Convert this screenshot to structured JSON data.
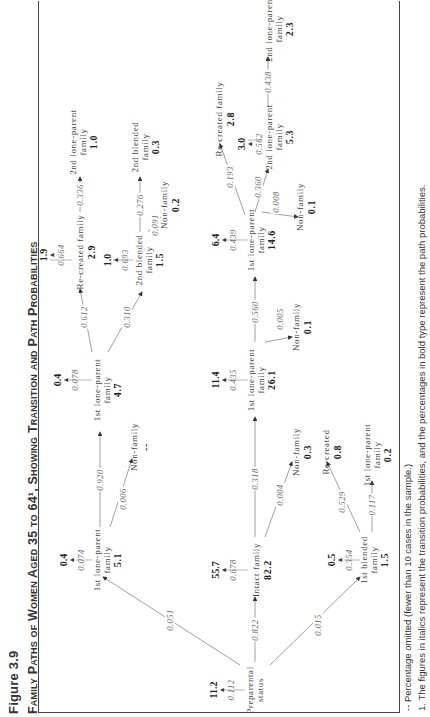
{
  "figure": {
    "label": "Figure 3.9",
    "title": "Family Paths of Women Aged 35 to 64¹, Showing Transition and Path Probabilities"
  },
  "nodes": {
    "preparental": {
      "label": "Preparental status",
      "line1": "Preparental",
      "line2": "status",
      "stay_prob": "0.112",
      "stay_pct": "11.2"
    },
    "lone1_a": {
      "line1": "1st lone-parent",
      "line2": "family",
      "pct": "5.1",
      "stay_prob": "0.074",
      "stay_pct": "0.4"
    },
    "nonfamily_a": {
      "line1": "Non-family",
      "pct": "--"
    },
    "lone1_b": {
      "line1": "1st lone-parent",
      "line2": "family",
      "pct": "4.7",
      "stay_prob": "0.078",
      "stay_pct": "0.4"
    },
    "recreated_a": {
      "line1": "Re-created family",
      "pct": "2.9",
      "stay_prob": "0.664",
      "stay_pct": "1.9"
    },
    "blended2_a": {
      "line1": "2nd blended",
      "line2": "family",
      "pct": "1.5",
      "stay_prob": "0.693",
      "stay_pct": "1.0"
    },
    "lone2_a": {
      "line1": "2nd  lone-parent",
      "line2": "family",
      "pct": "1.0"
    },
    "blended2_b": {
      "line1": "2nd blended",
      "line2": "family",
      "pct": "0.3"
    },
    "nonfamily_b": {
      "line1": "Non-family",
      "pct": "0.2"
    },
    "intact": {
      "line1": "Intact family",
      "pct": "82.2",
      "stay_prob": "0.678",
      "stay_pct": "55.7"
    },
    "lone1_c": {
      "line1": "1st lone-parent",
      "line2": "family",
      "pct": "26.1",
      "stay_prob": "0.435",
      "stay_pct": "11.4"
    },
    "nonfamily_c": {
      "line1": "Non-family",
      "pct": "0.3"
    },
    "lone1_d": {
      "line1": "1st lone-parent",
      "line2": "family",
      "pct": "14.6",
      "stay_prob": "0.439",
      "stay_pct": "6.4"
    },
    "nonfamily_d": {
      "line1": "Non-family",
      "pct": "0.1"
    },
    "recreated_b": {
      "line1": "Re-created family",
      "pct": "2.8"
    },
    "lone2_b": {
      "line1": "2nd  lone-parent",
      "line2": "family",
      "pct": "5.3",
      "stay_prob": "0.562",
      "stay_pct": "3.0"
    },
    "nonfamily_e": {
      "line1": "Non-family",
      "pct": "0.1"
    },
    "lone2_c": {
      "line1": "2nd  lone-parent",
      "line2": "family",
      "pct": "2.3"
    },
    "blended1": {
      "line1": "1st blended",
      "line2": "family",
      "pct": "1.5",
      "stay_prob": "0.354",
      "stay_pct": "0.5"
    },
    "recreated_c": {
      "line1": "Re-created",
      "pct": "0.8"
    },
    "lone1_e": {
      "line1": "1st lone-parent",
      "line2": "family",
      "pct": "0.2"
    }
  },
  "transitions": {
    "prep_to_lone1a": "0.051",
    "prep_to_intact": "0.822",
    "prep_to_blended1": "0.015",
    "lone1a_to_lone1b": "0.920",
    "lone1a_to_nonfam": "0.006",
    "lone1b_to_recreated": "0.612",
    "lone1b_to_blended2": "0.310",
    "recreated_to_lone2": "0.336",
    "blended2_to_blended2": "0.276",
    "blended2_to_nonfam": "0.091",
    "intact_to_lone1": "0.318",
    "intact_to_nonfam": "0.004",
    "lone1c_to_lone1d": "0.560",
    "lone1c_to_nonfam": "0.005",
    "lone1d_to_recreated": "0.193",
    "lone1d_to_lone2": "0.360",
    "lone1d_to_nonfam": "0.008",
    "lone2b_to_lone2c": "0.438",
    "blended1_to_recreated": "0.529",
    "blended1_to_lone1": "0.117"
  },
  "footnotes": {
    "dash": "--   Percentage omitted (fewer than 10 cases in the sample.)",
    "note1": "1.  The figures in italics represent the transition probabilities, and the percentages in bold type represent the path probabilities."
  }
}
